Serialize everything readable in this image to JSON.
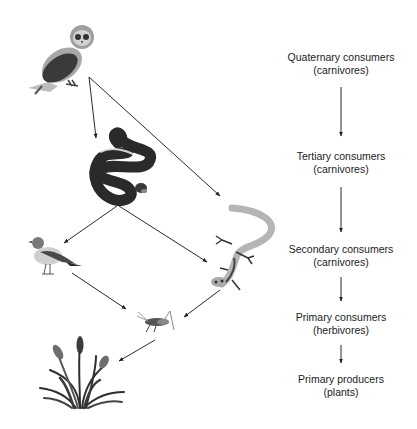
{
  "diagram": {
    "type": "food-web",
    "organisms": [
      {
        "id": "owl",
        "name": "Owl",
        "icon": "owl-icon",
        "level": "Quaternary consumers"
      },
      {
        "id": "snake",
        "name": "Snake",
        "icon": "snake-icon",
        "level": "Tertiary consumers"
      },
      {
        "id": "bird",
        "name": "Bird",
        "icon": "bird-icon",
        "level": "Secondary consumers"
      },
      {
        "id": "lizard",
        "name": "Lizard",
        "icon": "lizard-icon",
        "level": "Secondary consumers"
      },
      {
        "id": "grasshopper",
        "name": "Grasshopper",
        "icon": "grasshopper-icon",
        "level": "Primary consumers"
      },
      {
        "id": "plants",
        "name": "Plants",
        "icon": "plants-icon",
        "level": "Primary producers"
      }
    ],
    "arrows": [
      {
        "from": "owl",
        "to": "snake"
      },
      {
        "from": "owl",
        "to": "lizard"
      },
      {
        "from": "snake",
        "to": "bird"
      },
      {
        "from": "snake",
        "to": "lizard"
      },
      {
        "from": "bird",
        "to": "grasshopper"
      },
      {
        "from": "lizard",
        "to": "grasshopper"
      },
      {
        "from": "grasshopper",
        "to": "plants"
      }
    ],
    "levels": [
      {
        "title": "Quaternary consumers",
        "subtitle": "(carnivores)"
      },
      {
        "title": "Tertiary consumers",
        "subtitle": "(carnivores)"
      },
      {
        "title": "Secondary consumers",
        "subtitle": "(carnivores)"
      },
      {
        "title": "Primary consumers",
        "subtitle": "(herbivores)"
      },
      {
        "title": "Primary producers",
        "subtitle": "(plants)"
      }
    ]
  }
}
